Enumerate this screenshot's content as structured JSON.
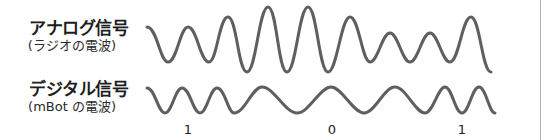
{
  "analog": {
    "title": "アナログ信号",
    "subtitle": "(ラジオの電波)",
    "wave_path": "M147,27 C157,27 160,62 168,62 C177,62 180,27 188,27 C197,27 200,62 209,62 C217,62 219,17 228,17 C237,17 238,72 247,72 C256,72 259,7 268,7 C277,7 278,72 287,72 C296,72 299,7 308,7 C317,7 319,72 328,72 C337,72 341,17 350,17 C359,17 362,62 370,62 C378,62 382,33 390,33 C398,33 402,62 410,62 C418,62 422,33 430,33 C438,33 442,62 450,62 C459,62 462,17 471,17 C480,17 482,72 491,72"
  },
  "digital": {
    "title": "デジタル信号",
    "subtitle": "(mBot の電波)",
    "wave_path": "M147,88 C155,88 158,113 165,113 C172,113 175,88 182,88 C190,88 193,113 200,113 C207,113 210,88 217,88 C225,88 228,113 234,113 C245,113 252,87 262,87 C274,87 285,113 297,113 C309,113 320,87 331,87 C342,87 353,113 364,113 C375,113 384,87 395,87 C406,87 415,113 425,113 C433,113 438,87 445,87 C452,87 455,113 462,113 C469,113 472,87 479,87 C486,87 489,113 495,113",
    "bits": [
      {
        "value": "1",
        "x": 188
      },
      {
        "value": "0",
        "x": 332
      },
      {
        "value": "1",
        "x": 462
      }
    ]
  },
  "style": {
    "wave_color": "#5f5f5f",
    "text_color": "#222222",
    "rule_color": "#b4b4b4"
  }
}
